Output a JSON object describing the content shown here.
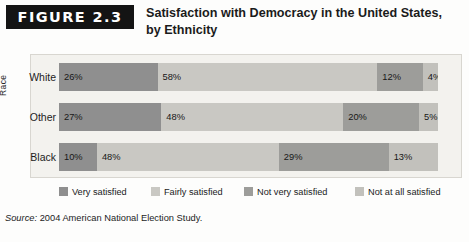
{
  "figure": {
    "banner_label": "FIGURE 2.3",
    "title": "Satisfaction with Democracy in the United States, by Ethnicity",
    "source": "2004 American National Election Study.",
    "source_word": "Source:"
  },
  "axis": {
    "y_title": "Race"
  },
  "legend": {
    "items": [
      {
        "label": "Very satisfied",
        "color": "#8f8f8f"
      },
      {
        "label": "Fairly satisfied",
        "color": "#c9c8c3"
      },
      {
        "label": "Not very satisfied",
        "color": "#9d9d9a"
      },
      {
        "label": "Not at all satisfied",
        "color": "#c2c1bc"
      }
    ]
  },
  "chart_data": {
    "type": "bar",
    "orientation": "horizontal",
    "stacked": true,
    "title": "Satisfaction with Democracy in the United States, by Ethnicity",
    "xlabel": "",
    "ylabel": "Race",
    "categories": [
      "White",
      "Other",
      "Black"
    ],
    "series": [
      {
        "name": "Very satisfied",
        "color": "#8f8f8f",
        "values": [
          26,
          27,
          10
        ]
      },
      {
        "name": "Fairly satisfied",
        "color": "#c9c8c3",
        "values": [
          58,
          48,
          48
        ]
      },
      {
        "name": "Not very satisfied",
        "color": "#9d9d9a",
        "values": [
          12,
          20,
          29
        ]
      },
      {
        "name": "Not at all satisfied",
        "color": "#c2c1bc",
        "values": [
          4,
          5,
          13
        ]
      }
    ],
    "value_labels": [
      [
        "26%",
        "58%",
        "12%",
        "4%"
      ],
      [
        "27%",
        "48%",
        "20%",
        "5%"
      ],
      [
        "10%",
        "48%",
        "29%",
        "13%"
      ]
    ],
    "xlim": [
      0,
      100
    ],
    "grid": false,
    "legend_position": "bottom",
    "units": "percent"
  },
  "rows": [
    {
      "label": "White",
      "cells": [
        "26%",
        "58%",
        "12%",
        "4%"
      ],
      "pct": [
        26,
        58,
        12,
        4
      ]
    },
    {
      "label": "Other",
      "cells": [
        "27%",
        "48%",
        "20%",
        "5%"
      ],
      "pct": [
        27,
        48,
        20,
        5
      ]
    },
    {
      "label": "Black",
      "cells": [
        "10%",
        "48%",
        "29%",
        "13%"
      ],
      "pct": [
        10,
        48,
        29,
        13
      ]
    }
  ]
}
